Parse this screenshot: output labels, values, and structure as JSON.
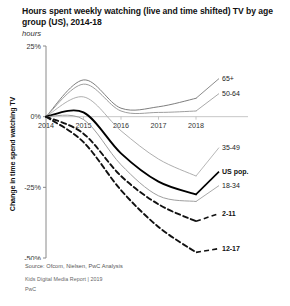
{
  "header": {
    "title": "Hours spent weekly watching (live and time shifted) TV by age group (US), 2014-18",
    "subtitle": "hours"
  },
  "footer": {
    "source": "Source: Ofcom, Nielsen, PwC Analysis",
    "report": "Kids Digital Media Report | 2019",
    "brand": "PwC"
  },
  "chart_data": {
    "type": "line",
    "title": "Hours spent weekly watching (live and time shifted) TV by age group (US), 2014-18",
    "subtitle": "hours",
    "xlabel": "",
    "ylabel": "Change in time spend watching TV",
    "x": [
      2014,
      2015,
      2016,
      2017,
      2018
    ],
    "xticklabels": [
      "2014",
      "2015",
      "2016",
      "2017",
      "2018"
    ],
    "yticklabels": [
      "25%",
      "0%",
      "-25%",
      "-50%"
    ],
    "ytickvalues": [
      25,
      0,
      -25,
      -50
    ],
    "ylim": [
      -50,
      25
    ],
    "xlim": [
      2014,
      2018
    ],
    "yunit": "%",
    "grid": false,
    "legend_position": "right-inline-labels",
    "series": [
      {
        "name": "65+",
        "values": [
          0,
          13.0,
          3.0,
          3.5,
          6.5
        ],
        "style": "solid",
        "color": "#777777",
        "emphasis": false
      },
      {
        "name": "50-64",
        "values": [
          0,
          11.5,
          2.0,
          1.5,
          2.0
        ],
        "style": "solid",
        "color": "#999999",
        "emphasis": false
      },
      {
        "name": "35-49",
        "values": [
          0,
          7.0,
          -5.0,
          -15.0,
          -21.0
        ],
        "style": "solid",
        "color": "#aaaaaa",
        "emphasis": false
      },
      {
        "name": "US pop.",
        "values": [
          0,
          1.5,
          -13.0,
          -23.0,
          -27.5
        ],
        "style": "solid",
        "color": "#000000",
        "emphasis": true
      },
      {
        "name": "18-34",
        "values": [
          0,
          -1.0,
          -17.0,
          -28.0,
          -30.0
        ],
        "style": "solid",
        "color": "#999999",
        "emphasis": false
      },
      {
        "name": "2-11",
        "values": [
          0,
          -6.0,
          -21.0,
          -31.0,
          -37.0
        ],
        "style": "dashed",
        "color": "#111111",
        "emphasis": true
      },
      {
        "name": "12-17",
        "values": [
          0,
          -9.0,
          -26.0,
          -39.0,
          -48.0
        ],
        "style": "dashed",
        "color": "#111111",
        "emphasis": true
      }
    ],
    "series_labels": [
      {
        "name": "65+",
        "bold": false
      },
      {
        "name": "50-64",
        "bold": false
      },
      {
        "name": "35-49",
        "bold": false
      },
      {
        "name": "US pop.",
        "bold": true
      },
      {
        "name": "18-34",
        "bold": false
      },
      {
        "name": "2-11",
        "bold": true
      },
      {
        "name": "12-17",
        "bold": true
      }
    ]
  }
}
